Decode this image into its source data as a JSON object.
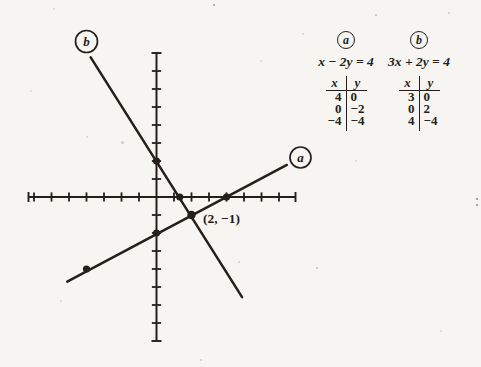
{
  "ink_color": "#241f1b",
  "paper_color": "#f6f5f1",
  "panel": {
    "columns": [
      {
        "label": "a",
        "equation": "x − 2y = 4",
        "table": {
          "col1": "x",
          "col2": "y",
          "rows": [
            [
              "4",
              "0"
            ],
            [
              "0",
              "−2"
            ],
            [
              "−4",
              "−4"
            ]
          ]
        }
      },
      {
        "label": "b",
        "equation": "3x + 2y = 4",
        "table": {
          "col1": "x",
          "col2": "y",
          "rows": [
            [
              "3",
              "0"
            ],
            [
              "0",
              "2"
            ],
            [
              "4",
              "−4"
            ]
          ]
        }
      }
    ]
  },
  "chart_data": {
    "type": "line",
    "title": "",
    "xlabel": "",
    "ylabel": "",
    "axes": {
      "x_range": [
        -7.3,
        7.9
      ],
      "y_range": [
        -8,
        8
      ],
      "tick_step": 1,
      "tick_labels": "none",
      "grid": false
    },
    "series": [
      {
        "name": "a",
        "equation": "x − 2y = 4",
        "slope": 0.5,
        "y_intercept": -2,
        "x_intercept": 4,
        "table_points": [
          [
            4,
            0
          ],
          [
            0,
            -2
          ],
          [
            -4,
            -4
          ]
        ],
        "drawn_segment": [
          [
            -5.1,
            -4.7
          ],
          [
            7.45,
            1.78
          ]
        ],
        "marked_points": [
          [
            -4,
            -4
          ],
          [
            0,
            -2
          ],
          [
            4,
            0
          ]
        ],
        "label_position": "at-upper-right-end"
      },
      {
        "name": "b",
        "equation": "3x + 2y = 4",
        "slope": -1.5,
        "y_intercept": 2,
        "x_intercept": 1.33,
        "table_points": [
          [
            3,
            0
          ],
          [
            0,
            2
          ],
          [
            4,
            -4
          ]
        ],
        "drawn_segment": [
          [
            -3.76,
            7.76
          ],
          [
            4.89,
            -5.56
          ]
        ],
        "marked_points": [
          [
            0,
            2
          ],
          [
            1.33,
            0
          ]
        ],
        "label_position": "at-upper-left-start"
      }
    ],
    "intersection": {
      "point": [
        2,
        -1
      ],
      "label": "(2, −1)"
    }
  }
}
